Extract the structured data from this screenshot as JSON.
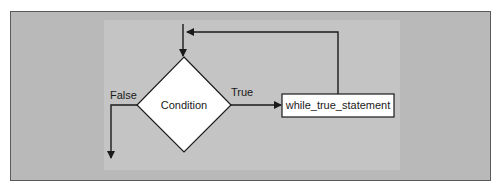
{
  "diagram": {
    "type": "flowchart",
    "nodes": {
      "decision": {
        "shape": "diamond",
        "label": "Condition"
      },
      "statement": {
        "shape": "rectangle",
        "label": "while_true_statement"
      }
    },
    "edges": {
      "true_label": "True",
      "false_label": "False"
    },
    "colors": {
      "frame_bg": "#b9b9b9",
      "panel_bg": "#c4c4c4",
      "node_fill": "#ffffff",
      "stroke": "#1a1a1a"
    }
  }
}
